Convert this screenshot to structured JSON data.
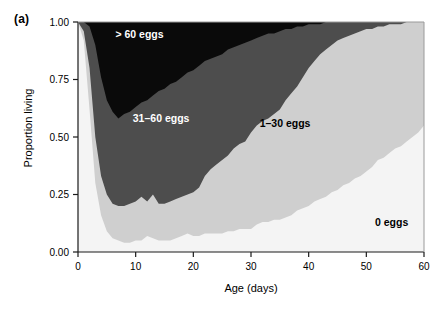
{
  "figure": {
    "panel_label": "(a)",
    "xlabel": "Age (days)",
    "ylabel": "Proportion living"
  },
  "axes": {
    "x_ticks": [
      "0",
      "10",
      "20",
      "30",
      "40",
      "50",
      "60"
    ],
    "y_ticks": [
      "0.00",
      "0.25",
      "0.50",
      "0.75",
      "1.00"
    ]
  },
  "band_labels": {
    "over60": "> 60 eggs",
    "b31_60": "31–60 eggs",
    "b1_30": "1–30 eggs",
    "zero": "0 eggs"
  },
  "colors": {
    "over60": "#0a0a0a",
    "b31_60": "#4d4d4d",
    "b1_30": "#cfcfcf",
    "zero": "#f4f4f4",
    "axis": "#1a1a1a",
    "plot_background": "#f7f7f7"
  },
  "chart_data": {
    "type": "area",
    "title": "",
    "subtitle": "",
    "xlabel": "Age (days)",
    "ylabel": "Proportion living",
    "xlim": [
      0,
      60
    ],
    "ylim": [
      0,
      1.0
    ],
    "xticks": [
      0,
      10,
      20,
      30,
      40,
      50,
      60
    ],
    "yticks": [
      0,
      0.25,
      0.5,
      0.75,
      1.0
    ],
    "grid": false,
    "legend": "inline-annotations",
    "stacked": true,
    "stack_order_bottom_to_top": [
      "0 eggs",
      "1-30 eggs",
      "31-60 eggs",
      "> 60 eggs"
    ],
    "annotations": [
      {
        "text": "> 60 eggs",
        "x": 6.5,
        "y": 0.93,
        "color": "#ffffff"
      },
      {
        "text": "31-60 eggs",
        "x": 9.5,
        "y": 0.565,
        "color": "#ffffff"
      },
      {
        "text": "1-30 eggs",
        "x": 31.5,
        "y": 0.545,
        "color": "#000000"
      },
      {
        "text": "0 eggs",
        "x": 51.5,
        "y": 0.115,
        "color": "#000000"
      }
    ],
    "x": [
      0,
      1,
      2,
      3,
      4,
      5,
      6,
      7,
      8,
      9,
      10,
      11,
      12,
      13,
      14,
      15,
      16,
      17,
      18,
      19,
      20,
      21,
      22,
      23,
      24,
      25,
      26,
      27,
      28,
      29,
      30,
      31,
      32,
      33,
      34,
      35,
      36,
      37,
      38,
      39,
      40,
      41,
      42,
      43,
      44,
      45,
      46,
      47,
      48,
      49,
      50,
      51,
      52,
      53,
      54,
      55,
      56,
      57,
      58,
      59,
      60
    ],
    "series": [
      {
        "name": "0 eggs",
        "note": "cumulative upper boundary of the 0-eggs band (bottom-most layer)",
        "values": [
          1.0,
          0.92,
          0.62,
          0.3,
          0.16,
          0.09,
          0.06,
          0.05,
          0.04,
          0.04,
          0.05,
          0.05,
          0.07,
          0.06,
          0.05,
          0.05,
          0.05,
          0.06,
          0.07,
          0.08,
          0.07,
          0.07,
          0.08,
          0.08,
          0.08,
          0.08,
          0.09,
          0.09,
          0.1,
          0.1,
          0.1,
          0.12,
          0.13,
          0.13,
          0.14,
          0.14,
          0.15,
          0.16,
          0.18,
          0.19,
          0.2,
          0.22,
          0.23,
          0.24,
          0.26,
          0.27,
          0.29,
          0.3,
          0.32,
          0.33,
          0.35,
          0.37,
          0.4,
          0.41,
          0.43,
          0.45,
          0.46,
          0.48,
          0.5,
          0.52,
          0.55
        ]
      },
      {
        "name": "1-30 eggs",
        "note": "cumulative upper boundary of 0 + 1-30 eggs bands",
        "values": [
          1.0,
          0.96,
          0.8,
          0.5,
          0.33,
          0.25,
          0.21,
          0.2,
          0.2,
          0.21,
          0.22,
          0.24,
          0.22,
          0.25,
          0.21,
          0.21,
          0.22,
          0.23,
          0.24,
          0.25,
          0.26,
          0.28,
          0.33,
          0.36,
          0.38,
          0.4,
          0.42,
          0.45,
          0.47,
          0.48,
          0.52,
          0.55,
          0.57,
          0.58,
          0.6,
          0.62,
          0.66,
          0.69,
          0.72,
          0.76,
          0.8,
          0.83,
          0.86,
          0.88,
          0.9,
          0.92,
          0.93,
          0.94,
          0.95,
          0.96,
          0.97,
          0.97,
          0.98,
          0.98,
          0.99,
          0.99,
          0.99,
          1.0,
          1.0,
          1.0,
          1.0
        ]
      },
      {
        "name": "31-60 eggs",
        "note": "cumulative upper boundary of 0 + 1-30 + 31-60 eggs bands",
        "values": [
          1.0,
          1.0,
          0.98,
          0.9,
          0.76,
          0.66,
          0.61,
          0.58,
          0.6,
          0.61,
          0.63,
          0.65,
          0.66,
          0.68,
          0.7,
          0.71,
          0.73,
          0.74,
          0.76,
          0.78,
          0.79,
          0.81,
          0.83,
          0.84,
          0.85,
          0.86,
          0.88,
          0.89,
          0.9,
          0.91,
          0.92,
          0.93,
          0.94,
          0.95,
          0.95,
          0.96,
          0.97,
          0.97,
          0.98,
          0.98,
          0.99,
          0.99,
          0.99,
          1.0,
          1.0,
          1.0,
          1.0,
          1.0,
          1.0,
          1.0,
          1.0,
          1.0,
          1.0,
          1.0,
          1.0,
          1.0,
          1.0,
          1.0,
          1.0,
          1.0,
          1.0
        ]
      },
      {
        "name": "> 60 eggs",
        "note": "cumulative upper boundary of all bands (total survivorship = 1.00)",
        "values": [
          1.0,
          1.0,
          1.0,
          1.0,
          1.0,
          1.0,
          1.0,
          1.0,
          1.0,
          1.0,
          1.0,
          1.0,
          1.0,
          1.0,
          1.0,
          1.0,
          1.0,
          1.0,
          1.0,
          1.0,
          1.0,
          1.0,
          1.0,
          1.0,
          1.0,
          1.0,
          1.0,
          1.0,
          1.0,
          1.0,
          1.0,
          1.0,
          1.0,
          1.0,
          1.0,
          1.0,
          1.0,
          1.0,
          1.0,
          1.0,
          1.0,
          1.0,
          1.0,
          1.0,
          1.0,
          1.0,
          1.0,
          1.0,
          1.0,
          1.0,
          1.0,
          1.0,
          1.0,
          1.0,
          1.0,
          1.0,
          1.0,
          1.0,
          1.0,
          1.0,
          1.0
        ]
      }
    ]
  }
}
